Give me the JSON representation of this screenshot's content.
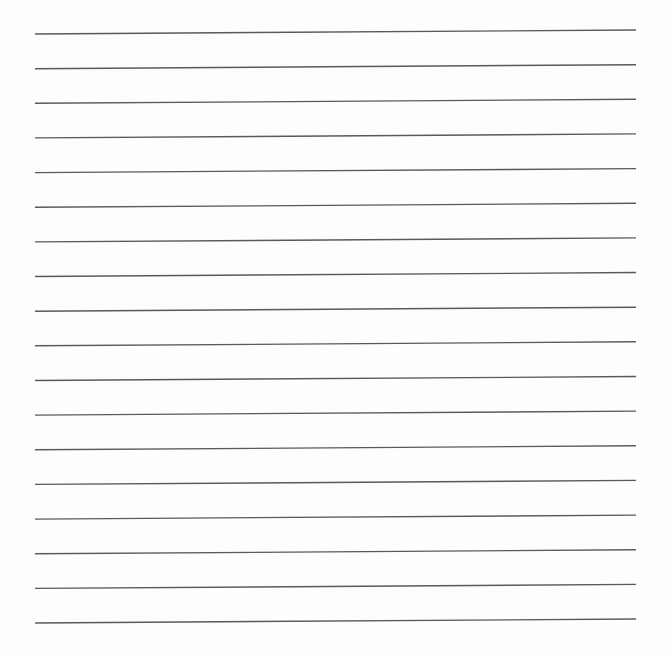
{
  "page": {
    "type": "lined-paper",
    "background": "#fdfdfd",
    "line_color": "#5a5a5a",
    "line_count": 18,
    "line_left_x": 35,
    "line_right_x": 636,
    "first_line_left_y": 34,
    "first_line_right_y": 30,
    "line_spacing": 34.65,
    "line_width": 1.4
  }
}
